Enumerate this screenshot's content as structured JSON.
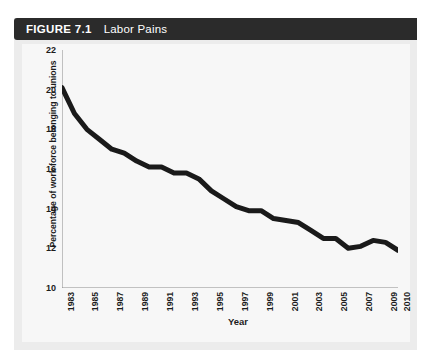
{
  "figure": {
    "number_label": "FIGURE 7.1",
    "title": "Labor Pains",
    "bar_color": "#2b2b2b",
    "panel_color": "#ececec",
    "canvas_color": "#f7f7f7"
  },
  "chart_data": {
    "type": "line",
    "title": "Labor Pains",
    "xlabel": "Year",
    "ylabel": "Percentage of work force belonging to unions",
    "line_color": "#1a1a1a",
    "line_width": 5,
    "grid": false,
    "legend": "none",
    "xlim": [
      1983,
      2010
    ],
    "ylim": [
      10,
      22
    ],
    "yticks": [
      10,
      12,
      14,
      16,
      18,
      20,
      22
    ],
    "ytick_labels": [
      "10",
      "12",
      "14",
      "16",
      "18",
      "20",
      "22"
    ],
    "xticks": [
      1983,
      1984,
      1985,
      1986,
      1987,
      1988,
      1989,
      1990,
      1991,
      1992,
      1993,
      1994,
      1995,
      1996,
      1997,
      1998,
      1999,
      2000,
      2001,
      2002,
      2003,
      2004,
      2005,
      2006,
      2007,
      2008,
      2009,
      2010
    ],
    "xtick_labels_shown": [
      "1983",
      "1985",
      "1987",
      "1989",
      "1991",
      "1993",
      "1995",
      "1997",
      "1999",
      "2001",
      "2003",
      "2005",
      "2007",
      "2009",
      "2010"
    ],
    "x": [
      1983,
      1984,
      1985,
      1986,
      1987,
      1988,
      1989,
      1990,
      1991,
      1992,
      1993,
      1994,
      1995,
      1996,
      1997,
      1998,
      1999,
      2000,
      2001,
      2002,
      2003,
      2004,
      2005,
      2006,
      2007,
      2008,
      2009,
      2010
    ],
    "values": [
      20.1,
      18.8,
      18.0,
      17.5,
      17.0,
      16.8,
      16.4,
      16.1,
      16.1,
      15.8,
      15.8,
      15.5,
      14.9,
      14.5,
      14.1,
      13.9,
      13.9,
      13.5,
      13.4,
      13.3,
      12.9,
      12.5,
      12.5,
      12.0,
      12.1,
      12.4,
      12.3,
      11.9
    ],
    "value_unit": "percent",
    "series": [
      {
        "name": "Percentage of work force belonging to unions",
        "values": [
          20.1,
          18.8,
          18.0,
          17.5,
          17.0,
          16.8,
          16.4,
          16.1,
          16.1,
          15.8,
          15.8,
          15.5,
          14.9,
          14.5,
          14.1,
          13.9,
          13.9,
          13.5,
          13.4,
          13.3,
          12.9,
          12.5,
          12.5,
          12.0,
          12.1,
          12.4,
          12.3,
          11.9
        ]
      }
    ]
  }
}
